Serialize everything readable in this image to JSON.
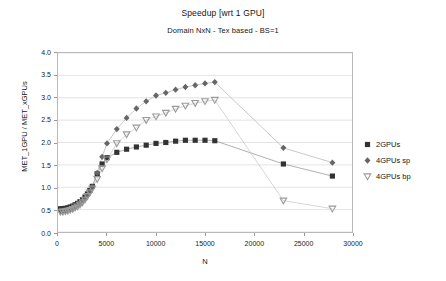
{
  "chart_data": {
    "type": "scatter",
    "title": "Speedup [wrt 1 GPU]",
    "subtitle": "Domain NxN - Tex based - BS=1",
    "xlabel": "N",
    "ylabel": "MET_1GPU / MET_xGPUs",
    "xlim": [
      0,
      30000
    ],
    "ylim": [
      0.0,
      4.0
    ],
    "grid": true,
    "grid_axis": "y",
    "legend_position": "right",
    "xticks": [
      "0",
      "5000",
      "10000",
      "15000",
      "20000",
      "25000",
      "30000"
    ],
    "xtick_values": [
      0,
      5000,
      10000,
      15000,
      20000,
      25000,
      30000
    ],
    "yticks": [
      "0.0",
      "0.5",
      "1.0",
      "1.5",
      "2.0",
      "2.5",
      "3.0",
      "3.5",
      "4.0"
    ],
    "ytick_values": [
      0.0,
      0.5,
      1.0,
      1.5,
      2.0,
      2.5,
      3.0,
      3.5,
      4.0
    ],
    "series": [
      {
        "name": "2GPUs",
        "marker": "square",
        "color": "#333333",
        "line_color": "#8c8c8c",
        "points": [
          [
            250,
            0.52
          ],
          [
            500,
            0.52
          ],
          [
            750,
            0.53
          ],
          [
            1000,
            0.54
          ],
          [
            1250,
            0.56
          ],
          [
            1500,
            0.58
          ],
          [
            1750,
            0.61
          ],
          [
            2000,
            0.64
          ],
          [
            2250,
            0.68
          ],
          [
            2500,
            0.72
          ],
          [
            2750,
            0.78
          ],
          [
            3000,
            0.85
          ],
          [
            3250,
            0.93
          ],
          [
            3500,
            1.02
          ],
          [
            4000,
            1.3
          ],
          [
            4500,
            1.52
          ],
          [
            5000,
            1.66
          ],
          [
            6000,
            1.78
          ],
          [
            7000,
            1.85
          ],
          [
            8000,
            1.9
          ],
          [
            9000,
            1.94
          ],
          [
            10000,
            1.98
          ],
          [
            11000,
            2.0
          ],
          [
            12000,
            2.03
          ],
          [
            13000,
            2.05
          ],
          [
            14000,
            2.05
          ],
          [
            15000,
            2.05
          ],
          [
            16000,
            2.04
          ],
          [
            23000,
            1.52
          ],
          [
            28000,
            1.25
          ]
        ]
      },
      {
        "name": "4GPUs sp",
        "marker": "diamond",
        "color": "#666666",
        "line_color": "#b0b0b0",
        "points": [
          [
            250,
            0.47
          ],
          [
            500,
            0.47
          ],
          [
            750,
            0.48
          ],
          [
            1000,
            0.49
          ],
          [
            1250,
            0.51
          ],
          [
            1500,
            0.53
          ],
          [
            1750,
            0.56
          ],
          [
            2000,
            0.59
          ],
          [
            2250,
            0.63
          ],
          [
            2500,
            0.68
          ],
          [
            2750,
            0.74
          ],
          [
            3000,
            0.82
          ],
          [
            3250,
            0.9
          ],
          [
            3500,
            1.0
          ],
          [
            4000,
            1.32
          ],
          [
            4500,
            1.68
          ],
          [
            5000,
            1.98
          ],
          [
            6000,
            2.3
          ],
          [
            7000,
            2.55
          ],
          [
            8000,
            2.76
          ],
          [
            9000,
            2.92
          ],
          [
            10000,
            3.05
          ],
          [
            11000,
            3.11
          ],
          [
            12000,
            3.18
          ],
          [
            13000,
            3.24
          ],
          [
            14000,
            3.28
          ],
          [
            15000,
            3.32
          ],
          [
            16000,
            3.35
          ],
          [
            23000,
            1.88
          ],
          [
            28000,
            1.55
          ]
        ]
      },
      {
        "name": "4GPUs bp",
        "marker": "triangle-down",
        "color": "#9a9a9a",
        "line_color": "#c4c4c4",
        "points": [
          [
            250,
            0.45
          ],
          [
            500,
            0.45
          ],
          [
            750,
            0.46
          ],
          [
            1000,
            0.47
          ],
          [
            1250,
            0.49
          ],
          [
            1500,
            0.51
          ],
          [
            1750,
            0.54
          ],
          [
            2000,
            0.57
          ],
          [
            2250,
            0.61
          ],
          [
            2500,
            0.66
          ],
          [
            2750,
            0.72
          ],
          [
            3000,
            0.8
          ],
          [
            3250,
            0.88
          ],
          [
            3500,
            0.97
          ],
          [
            4000,
            1.18
          ],
          [
            4500,
            1.42
          ],
          [
            5000,
            1.62
          ],
          [
            6000,
            1.98
          ],
          [
            7000,
            2.18
          ],
          [
            8000,
            2.33
          ],
          [
            9000,
            2.5
          ],
          [
            10000,
            2.58
          ],
          [
            11000,
            2.66
          ],
          [
            12000,
            2.75
          ],
          [
            13000,
            2.82
          ],
          [
            14000,
            2.88
          ],
          [
            15000,
            2.92
          ],
          [
            16000,
            2.95
          ],
          [
            23000,
            0.7
          ],
          [
            28000,
            0.52
          ]
        ]
      }
    ]
  },
  "legend": {
    "items": [
      {
        "label": "2GPUs"
      },
      {
        "label": "4GPUs sp"
      },
      {
        "label": "4GPUs bp"
      }
    ]
  }
}
